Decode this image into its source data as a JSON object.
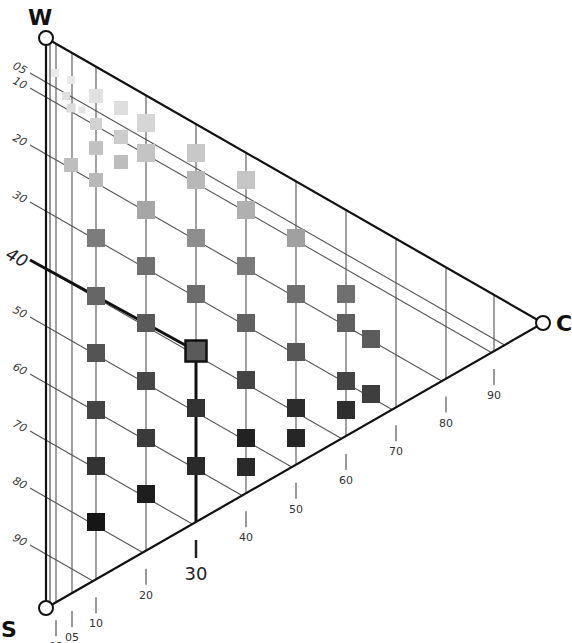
{
  "chart_data": {
    "type": "ternary",
    "title": "",
    "vertices": {
      "top": "W",
      "bottom_left": "S",
      "right": "C"
    },
    "left_axis_ticks": [
      "05",
      "10",
      "20",
      "30",
      "40",
      "50",
      "60",
      "70",
      "80",
      "90"
    ],
    "bottom_axis_ticks": [
      "02",
      "05",
      "10",
      "20",
      "30",
      "40",
      "50",
      "60",
      "70",
      "80",
      "90"
    ],
    "highlighted_reading": {
      "left_axis": "40",
      "bottom_axis": "30"
    },
    "marker_shape": "square",
    "color_scale": "grayscale (lighter toward W, darker toward S)",
    "points": [
      {
        "x": 55,
        "y": 73,
        "s": 8,
        "gray": "#ececec"
      },
      {
        "x": 71,
        "y": 80,
        "s": 8,
        "gray": "#e8e8e8"
      },
      {
        "x": 66,
        "y": 96,
        "s": 8,
        "gray": "#e0e0e0"
      },
      {
        "x": 71,
        "y": 108,
        "s": 9,
        "gray": "#dcdcdc"
      },
      {
        "x": 82,
        "y": 110,
        "s": 7,
        "gray": "#e4e4e4"
      },
      {
        "x": 96,
        "y": 96,
        "s": 14,
        "gray": "#e2e2e2"
      },
      {
        "x": 96,
        "y": 124,
        "s": 12,
        "gray": "#d2d2d2"
      },
      {
        "x": 121,
        "y": 108,
        "s": 14,
        "gray": "#dedede"
      },
      {
        "x": 121,
        "y": 137,
        "s": 14,
        "gray": "#cccccc"
      },
      {
        "x": 121,
        "y": 162,
        "s": 14,
        "gray": "#bdbdbd"
      },
      {
        "x": 146,
        "y": 123,
        "s": 18,
        "gray": "#d6d6d6"
      },
      {
        "x": 96,
        "y": 148,
        "s": 14,
        "gray": "#c2c2c2"
      },
      {
        "x": 96,
        "y": 180,
        "s": 14,
        "gray": "#b8b8b8"
      },
      {
        "x": 71,
        "y": 165,
        "s": 14,
        "gray": "#bebebe"
      },
      {
        "x": 146,
        "y": 153,
        "s": 18,
        "gray": "#c4c4c4"
      },
      {
        "x": 196,
        "y": 153,
        "s": 18,
        "gray": "#c8c8c8"
      },
      {
        "x": 196,
        "y": 180,
        "s": 18,
        "gray": "#b8b8b8"
      },
      {
        "x": 246,
        "y": 180,
        "s": 18,
        "gray": "#c6c6c6"
      },
      {
        "x": 146,
        "y": 210,
        "s": 18,
        "gray": "#a6a6a6"
      },
      {
        "x": 246,
        "y": 210,
        "s": 18,
        "gray": "#b0b0b0"
      },
      {
        "x": 96,
        "y": 238,
        "s": 18,
        "gray": "#7c7c7c"
      },
      {
        "x": 196,
        "y": 238,
        "s": 18,
        "gray": "#8e8e8e"
      },
      {
        "x": 296,
        "y": 238,
        "s": 18,
        "gray": "#a0a0a0"
      },
      {
        "x": 146,
        "y": 266,
        "s": 18,
        "gray": "#707070"
      },
      {
        "x": 246,
        "y": 266,
        "s": 18,
        "gray": "#7a7a7a"
      },
      {
        "x": 96,
        "y": 296,
        "s": 18,
        "gray": "#666666"
      },
      {
        "x": 196,
        "y": 294,
        "s": 18,
        "gray": "#6c6c6c"
      },
      {
        "x": 296,
        "y": 294,
        "s": 18,
        "gray": "#6e6e6e"
      },
      {
        "x": 346,
        "y": 294,
        "s": 18,
        "gray": "#707070"
      },
      {
        "x": 146,
        "y": 323,
        "s": 18,
        "gray": "#5a5a5a"
      },
      {
        "x": 246,
        "y": 323,
        "s": 18,
        "gray": "#626262"
      },
      {
        "x": 346,
        "y": 323,
        "s": 18,
        "gray": "#606060"
      },
      {
        "x": 371,
        "y": 339,
        "s": 18,
        "gray": "#5c5c5c"
      },
      {
        "x": 96,
        "y": 353,
        "s": 18,
        "gray": "#545454"
      },
      {
        "x": 296,
        "y": 352,
        "s": 18,
        "gray": "#575757"
      },
      {
        "x": 146,
        "y": 381,
        "s": 18,
        "gray": "#474747"
      },
      {
        "x": 246,
        "y": 380,
        "s": 18,
        "gray": "#444444"
      },
      {
        "x": 346,
        "y": 381,
        "s": 18,
        "gray": "#444444"
      },
      {
        "x": 371,
        "y": 394,
        "s": 18,
        "gray": "#3e3e3e"
      },
      {
        "x": 96,
        "y": 410,
        "s": 18,
        "gray": "#444444"
      },
      {
        "x": 196,
        "y": 408,
        "s": 18,
        "gray": "#333333"
      },
      {
        "x": 296,
        "y": 408,
        "s": 18,
        "gray": "#2c2c2c"
      },
      {
        "x": 346,
        "y": 410,
        "s": 18,
        "gray": "#2e2e2e"
      },
      {
        "x": 146,
        "y": 438,
        "s": 18,
        "gray": "#3a3a3a"
      },
      {
        "x": 246,
        "y": 438,
        "s": 18,
        "gray": "#222222"
      },
      {
        "x": 296,
        "y": 438,
        "s": 18,
        "gray": "#262626"
      },
      {
        "x": 96,
        "y": 466,
        "s": 18,
        "gray": "#333333"
      },
      {
        "x": 196,
        "y": 466,
        "s": 18,
        "gray": "#2a2a2a"
      },
      {
        "x": 246,
        "y": 467,
        "s": 18,
        "gray": "#2a2a2a"
      },
      {
        "x": 146,
        "y": 494,
        "s": 18,
        "gray": "#1e1e1e"
      },
      {
        "x": 96,
        "y": 522,
        "s": 18,
        "gray": "#161616"
      }
    ],
    "highlighted_point": {
      "x": 196,
      "y": 351,
      "s": 21,
      "gray": "#5a5a5a"
    }
  },
  "labels": {
    "vertex_top": "W",
    "vertex_bottom_left": "S",
    "vertex_right": "C"
  },
  "left_ticks": [
    {
      "label": "05",
      "y": 73
    },
    {
      "label": "10",
      "y": 88
    },
    {
      "label": "20",
      "y": 145
    },
    {
      "label": "30",
      "y": 202
    },
    {
      "label": "40",
      "y": 260
    },
    {
      "label": "50",
      "y": 317
    },
    {
      "label": "60",
      "y": 374
    },
    {
      "label": "70",
      "y": 431
    },
    {
      "label": "80",
      "y": 488
    },
    {
      "label": "90",
      "y": 545
    }
  ],
  "bottom_ticks": [
    {
      "label": "02",
      "x": 56
    },
    {
      "label": "05",
      "x": 72
    },
    {
      "label": "10",
      "x": 96
    },
    {
      "label": "20",
      "x": 146
    },
    {
      "label": "30",
      "x": 196
    },
    {
      "label": "40",
      "x": 246
    },
    {
      "label": "50",
      "x": 296
    },
    {
      "label": "60",
      "x": 346
    },
    {
      "label": "70",
      "x": 396
    },
    {
      "label": "80",
      "x": 446
    },
    {
      "label": "90",
      "x": 494
    }
  ]
}
